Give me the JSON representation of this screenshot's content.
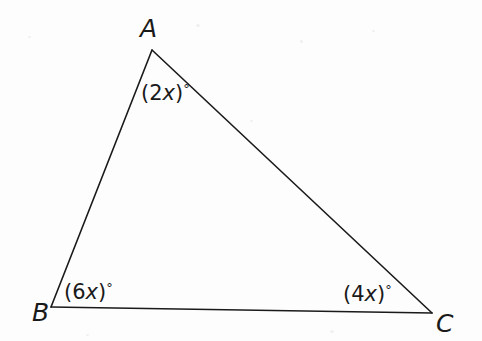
{
  "figure": {
    "type": "triangle-diagram",
    "stroke_color": "#1a1a1a",
    "background_color": "#fdfdfd",
    "stroke_width": 1.6,
    "vertices": [
      {
        "name": "A",
        "label": "A",
        "x": 152,
        "y": 50
      },
      {
        "name": "B",
        "label": "B",
        "x": 51,
        "y": 307
      },
      {
        "name": "C",
        "label": "C",
        "x": 432,
        "y": 313
      }
    ],
    "angles": [
      {
        "at": "A",
        "open": "(",
        "coefficient": "2",
        "variable": "x",
        "close": ")",
        "degree": "°",
        "text": "(2x)°"
      },
      {
        "at": "B",
        "open": "(",
        "coefficient": "6",
        "variable": "x",
        "close": ")",
        "degree": "°",
        "text": "(6x)°"
      },
      {
        "at": "C",
        "open": "(",
        "coefficient": "4",
        "variable": "x",
        "close": ")",
        "degree": "°",
        "text": "(4x)°"
      }
    ]
  }
}
